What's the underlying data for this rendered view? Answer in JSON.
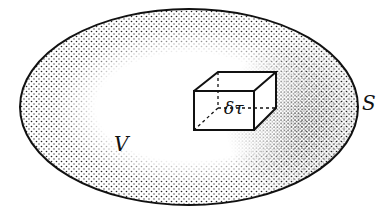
{
  "diagram": {
    "labels": {
      "surface": "S",
      "volume": "V",
      "element": "δτ"
    },
    "colors": {
      "ink": "#111111",
      "background": "#ffffff"
    }
  }
}
